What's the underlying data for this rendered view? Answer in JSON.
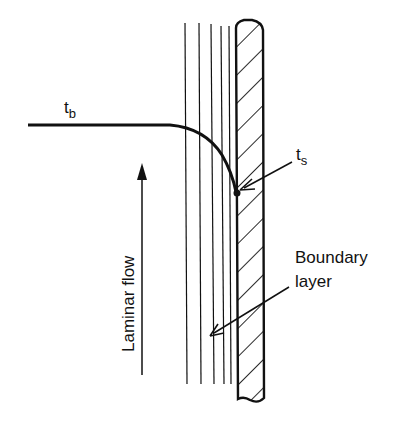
{
  "diagram": {
    "labels": {
      "bulk_temp_main": "t",
      "bulk_temp_sub": "b",
      "surface_temp_main": "t",
      "surface_temp_sub": "s",
      "flow": "Laminar flow",
      "boundary_line1": "Boundary",
      "boundary_line2": "layer"
    },
    "colors": {
      "ink": "#111111",
      "background": "#ffffff"
    }
  }
}
